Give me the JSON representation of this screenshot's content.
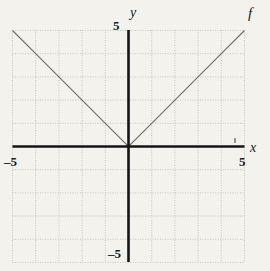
{
  "figure": {
    "background_color": "#f4f2ec",
    "grid_color": "#b9b6ae",
    "axis_color": "#1a1a1a",
    "curve_color": "#6b6862"
  },
  "labels": {
    "y_axis": "y",
    "x_axis": "x",
    "function": "f",
    "y_top_tick": "5",
    "y_bottom_tick": "–5",
    "x_left_tick": "–5",
    "x_right_tick": "5"
  },
  "chart_data": {
    "type": "line",
    "title": "",
    "subtitle": "",
    "xlabel": "x",
    "ylabel": "y",
    "xlim": [
      -5,
      5
    ],
    "ylim": [
      -5,
      5
    ],
    "xticks": [
      -5,
      5
    ],
    "yticks": [
      -5,
      5
    ],
    "xtick_labels": [
      "–5",
      "5"
    ],
    "ytick_labels": [
      "–5",
      "5"
    ],
    "grid": true,
    "grid_step": 1,
    "legend": false,
    "annotations": [
      {
        "text": "f",
        "x": 5,
        "y": 5.4
      }
    ],
    "series": [
      {
        "name": "f",
        "expression": "f(x) = |x|",
        "x": [
          -5,
          -4,
          -3,
          -2,
          -1,
          0,
          1,
          2,
          3,
          4,
          5
        ],
        "values": [
          5,
          4,
          3,
          2,
          1,
          0,
          1,
          2,
          3,
          4,
          5
        ]
      }
    ]
  }
}
